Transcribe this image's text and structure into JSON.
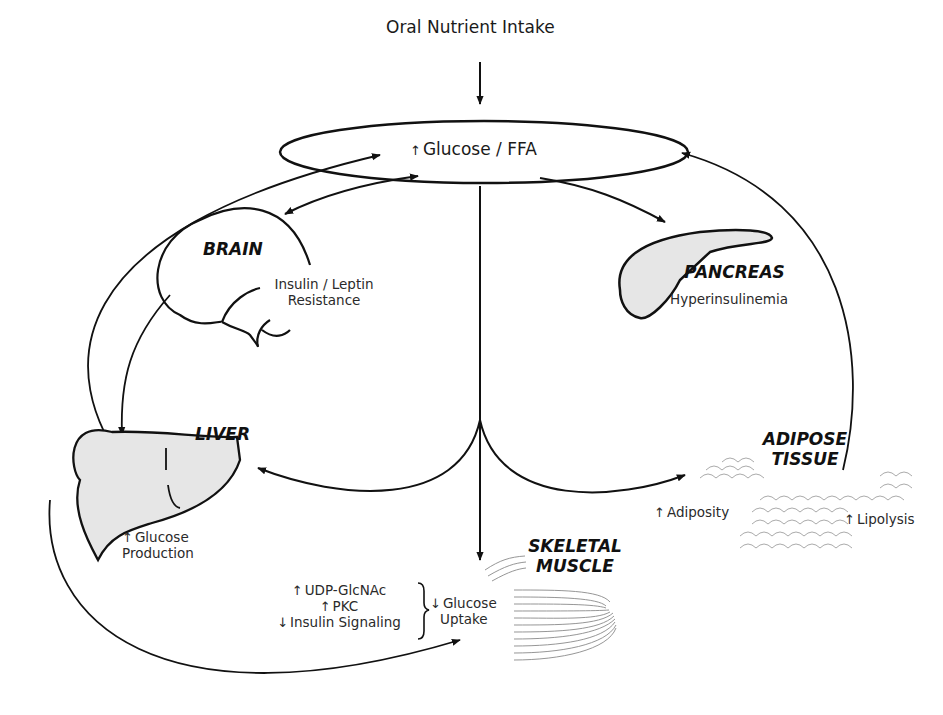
{
  "title_input": "Oral Nutrient Intake",
  "hub": {
    "arrow": "↑",
    "label": "Glucose / FFA"
  },
  "organs": {
    "brain": {
      "name": "BRAIN",
      "effect_line1": "Insulin / Leptin",
      "effect_line2": "Resistance"
    },
    "pancreas": {
      "name": "PANCREAS",
      "effect": "Hyperinsulinemia"
    },
    "liver": {
      "name": "LIVER",
      "arrow": "↑",
      "effect_line1": "Glucose",
      "effect_line2": "Production"
    },
    "adipose": {
      "name_line1": "ADIPOSE",
      "name_line2": "TISSUE",
      "left_arrow": "↑",
      "left_effect": "Adiposity",
      "right_arrow": "↑",
      "right_effect": "Lipolysis"
    },
    "muscle": {
      "name_line1": "SKELETAL",
      "name_line2": "MUSCLE",
      "factors": [
        {
          "arrow": "↑",
          "label": "UDP-GlcNAc"
        },
        {
          "arrow": "↑",
          "label": "PKC"
        },
        {
          "arrow": "↓",
          "label": "Insulin Signaling"
        }
      ],
      "outcome_arrow": "↓",
      "outcome_line1": "Glucose",
      "outcome_line2": "Uptake"
    }
  },
  "colors": {
    "line": "#111111",
    "organ_fill": "#e6e6e6",
    "texture": "#9a9a9a"
  }
}
